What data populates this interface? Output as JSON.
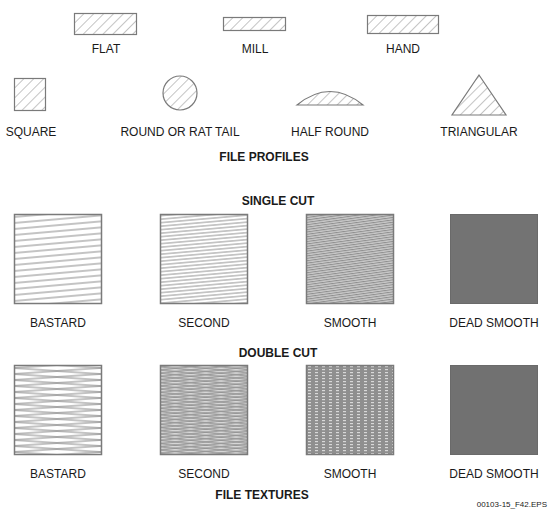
{
  "profiles": {
    "title": "FILE PROFILES",
    "items": [
      {
        "label": "FLAT",
        "shape": "rect-wide"
      },
      {
        "label": "MILL",
        "shape": "rect-thin"
      },
      {
        "label": "HAND",
        "shape": "rect-wide"
      },
      {
        "label": "SQUARE",
        "shape": "square"
      },
      {
        "label": "ROUND OR RAT TAIL",
        "shape": "circle"
      },
      {
        "label": "HALF ROUND",
        "shape": "half-round"
      },
      {
        "label": "TRIANGULAR",
        "shape": "triangle"
      }
    ]
  },
  "single_cut": {
    "title": "SINGLE CUT",
    "items": [
      {
        "label": "BASTARD"
      },
      {
        "label": "SECOND"
      },
      {
        "label": "SMOOTH"
      },
      {
        "label": "DEAD SMOOTH"
      }
    ]
  },
  "double_cut": {
    "title": "DOUBLE CUT",
    "items": [
      {
        "label": "BASTARD"
      },
      {
        "label": "SECOND"
      },
      {
        "label": "SMOOTH"
      },
      {
        "label": "DEAD SMOOTH"
      }
    ]
  },
  "textures_title": "FILE TEXTURES",
  "figure_id": "00103-15_F42.EPS",
  "colors": {
    "stroke": "#7a7a7a",
    "dark_fill": "#6e6e6e"
  }
}
